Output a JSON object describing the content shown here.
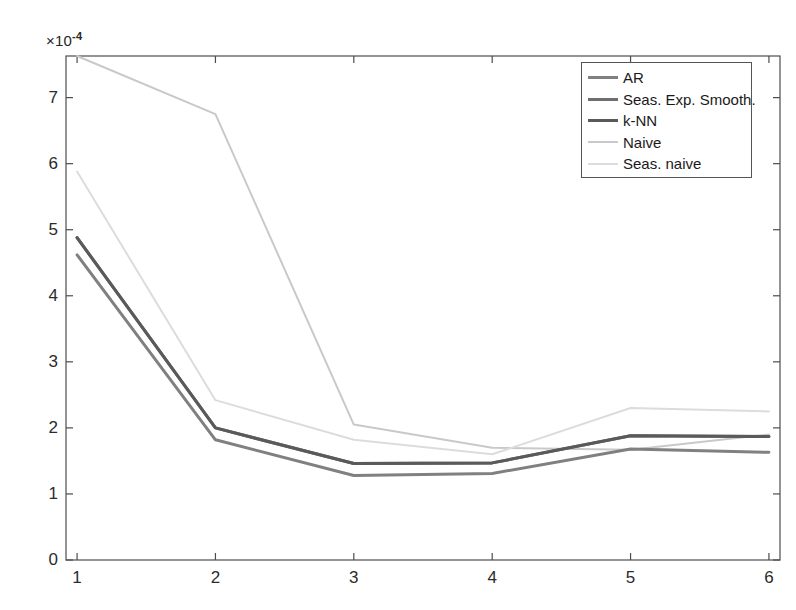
{
  "chart_data": {
    "type": "line",
    "title": "",
    "xlabel": "",
    "ylabel": "",
    "y_exponent_label": "×10",
    "y_exponent_value": "-4",
    "y_scale_factor": 0.0001,
    "xlim": [
      0.92,
      6.08
    ],
    "ylim": [
      0,
      7.63
    ],
    "xticks": [
      1,
      2,
      3,
      4,
      5,
      6
    ],
    "xticklabels": [
      "1",
      "2",
      "3",
      "4",
      "5",
      "6"
    ],
    "yticks": [
      0,
      1,
      2,
      3,
      4,
      5,
      6,
      7
    ],
    "yticklabels": [
      "0",
      "1",
      "2",
      "3",
      "4",
      "5",
      "6",
      "7"
    ],
    "grid": false,
    "legend_position": "upper right",
    "box": true,
    "x": [
      1,
      2,
      3,
      4,
      5,
      6
    ],
    "series": [
      {
        "name": "AR",
        "color": "#808080",
        "linewidth": 3,
        "values": [
          4.62,
          1.82,
          1.28,
          1.31,
          1.68,
          1.63
        ]
      },
      {
        "name": "Seas. Exp. Smooth.",
        "color": "#6e6e6e",
        "linewidth": 3,
        "values": [
          4.88,
          2.0,
          1.46,
          1.47,
          1.88,
          1.87
        ]
      },
      {
        "name": "k-NN",
        "color": "#5a5a5a",
        "linewidth": 3,
        "values": [
          4.88,
          2.0,
          1.46,
          1.47,
          1.88,
          1.87
        ]
      },
      {
        "name": "Naive",
        "color": "#c9c9c9",
        "linewidth": 2,
        "values": [
          7.63,
          6.75,
          2.05,
          1.7,
          1.67,
          1.9
        ]
      },
      {
        "name": "Seas. naive",
        "color": "#dcdcdc",
        "linewidth": 2,
        "values": [
          5.88,
          2.42,
          1.82,
          1.6,
          2.3,
          2.25
        ]
      }
    ]
  },
  "legend": {
    "entries": [
      {
        "label": "AR"
      },
      {
        "label": "Seas. Exp. Smooth."
      },
      {
        "label": "k-NN"
      },
      {
        "label": "Naive"
      },
      {
        "label": "Seas. naive"
      }
    ]
  },
  "axes": {
    "exponent_prefix": "×10",
    "exponent_sup": "-4"
  },
  "colors": {
    "axis": "#4d4d4d",
    "background": "#ffffff",
    "tick_text": "#2b2b2b",
    "legend_border": "#555555"
  }
}
